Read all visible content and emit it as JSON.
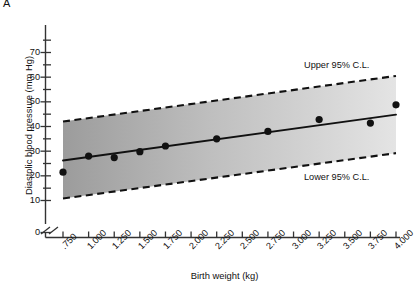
{
  "panel": {
    "label": "A"
  },
  "chart_data": {
    "type": "scatter",
    "title": "",
    "xlabel": "Birth weight (kg)",
    "ylabel": "Diastolic blood pressure (mm Hg)",
    "xlim": [
      0.625,
      4.125
    ],
    "ylim": [
      0,
      75
    ],
    "grid": false,
    "legend_position": "inside-right",
    "y_axis_break": true,
    "y_break_between": [
      0,
      10
    ],
    "yticks": [
      0,
      10,
      20,
      30,
      40,
      50,
      60,
      70
    ],
    "ytick_labels": [
      "0",
      "10",
      "20",
      "30",
      "40",
      "50",
      "60",
      "70"
    ],
    "x": [
      0.75,
      1.0,
      1.25,
      1.5,
      1.75,
      2.0,
      2.25,
      2.5,
      2.75,
      3.0,
      3.25,
      3.5,
      3.75,
      4.0
    ],
    "xtick_labels": [
      ".750",
      "1.000",
      "1.250",
      "1.500",
      "1.750",
      "2.000",
      "2.250",
      "2.500",
      "2.750",
      "3.000",
      "3.250",
      "3.500",
      "3.750",
      "4.000"
    ],
    "series": [
      {
        "name": "Observed means",
        "type": "scatter",
        "marker": "filled-circle",
        "color": "#111111",
        "points": [
          {
            "x": 0.75,
            "y": 21.5
          },
          {
            "x": 1.0,
            "y": 28.0
          },
          {
            "x": 1.25,
            "y": 27.4
          },
          {
            "x": 1.5,
            "y": 29.8
          },
          {
            "x": 1.75,
            "y": 32.1
          },
          {
            "x": 2.25,
            "y": 35.0
          },
          {
            "x": 2.75,
            "y": 38.0
          },
          {
            "x": 3.25,
            "y": 42.8
          },
          {
            "x": 3.75,
            "y": 41.4
          },
          {
            "x": 4.0,
            "y": 48.8
          }
        ]
      },
      {
        "name": "Regression line",
        "type": "line",
        "style": "solid",
        "color": "#111111",
        "endpoints": [
          {
            "x": 0.75,
            "y": 26.2
          },
          {
            "x": 4.0,
            "y": 44.8
          }
        ]
      },
      {
        "name": "Upper 95% C.L.",
        "type": "line",
        "style": "dashed",
        "color": "#111111",
        "endpoints": [
          {
            "x": 0.75,
            "y": 42.0
          },
          {
            "x": 4.0,
            "y": 60.5
          }
        ]
      },
      {
        "name": "Lower 95% C.L.",
        "type": "line",
        "style": "dashed",
        "color": "#111111",
        "endpoints": [
          {
            "x": 0.75,
            "y": 10.8
          },
          {
            "x": 4.0,
            "y": 29.2
          }
        ]
      }
    ],
    "band": {
      "name": "95% confidence band",
      "fill_left": "#9c9c9c",
      "fill_right": "#e2e2e2"
    },
    "annotations": [
      {
        "text": "Upper 95% C.L.",
        "x": 3.2,
        "y": 62
      },
      {
        "text": "Lower 95% C.L.",
        "x": 3.2,
        "y": 21
      }
    ]
  },
  "colors": {
    "axis": "#333333",
    "ink": "#111111",
    "band_dark": "#9c9c9c",
    "band_light": "#e2e2e2",
    "background": "#ffffff"
  }
}
